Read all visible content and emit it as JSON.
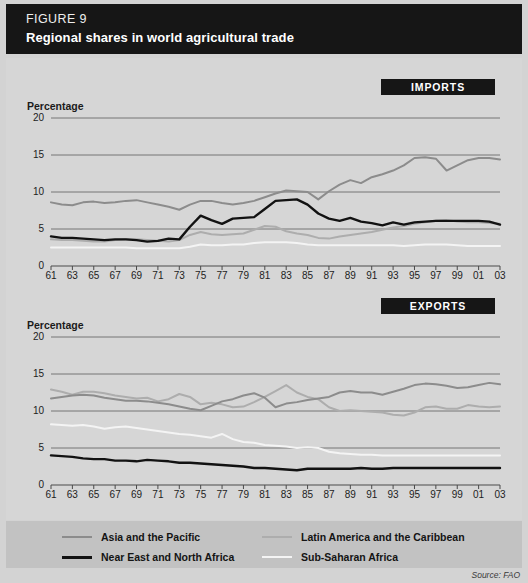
{
  "header": {
    "figure_label": "FIGURE 9",
    "title": "Regional shares in world agricultural trade"
  },
  "source": "Source: FAO",
  "panels": [
    {
      "key": "imports",
      "badge": "IMPORTS",
      "axis_title": "Percentage"
    },
    {
      "key": "exports",
      "badge": "EXPORTS",
      "axis_title": "Percentage"
    }
  ],
  "legend": {
    "items": [
      {
        "label": "Asia and the Pacific",
        "color": "#8c8c8c"
      },
      {
        "label": "Near East and North Africa",
        "color": "#121212"
      },
      {
        "label": "Latin America and the Caribbean",
        "color": "#adadad"
      },
      {
        "label": "Sub-Saharan Africa",
        "color": "#f4f4f4"
      }
    ]
  },
  "colors": {
    "panel_background": "#d6d6d6",
    "legend_background": "#c2c2c2",
    "header_background": "#161616",
    "gridline": "#5d5d5d",
    "axis": "#4a4a4a",
    "text": "#1d1d1d"
  },
  "chart_data": [
    {
      "type": "line",
      "title": "IMPORTS",
      "subtitle": "Regional shares in world agricultural trade — imports",
      "xlabel": "",
      "ylabel": "Percentage",
      "xlim": [
        1961,
        2003
      ],
      "ylim": [
        0,
        20
      ],
      "yticks": [
        0,
        5,
        10,
        15,
        20
      ],
      "grid": true,
      "legend_position": "bottom",
      "x": [
        1961,
        1962,
        1963,
        1964,
        1965,
        1966,
        1967,
        1968,
        1969,
        1970,
        1971,
        1972,
        1973,
        1974,
        1975,
        1976,
        1977,
        1978,
        1979,
        1980,
        1981,
        1982,
        1983,
        1984,
        1985,
        1986,
        1987,
        1988,
        1989,
        1990,
        1991,
        1992,
        1993,
        1994,
        1995,
        1996,
        1997,
        1998,
        1999,
        2000,
        2001,
        2002,
        2003
      ],
      "xtick_labels": [
        "61",
        "63",
        "65",
        "67",
        "69",
        "71",
        "73",
        "75",
        "77",
        "79",
        "81",
        "83",
        "85",
        "87",
        "89",
        "91",
        "93",
        "95",
        "97",
        "99",
        "01",
        "03"
      ],
      "series": [
        {
          "name": "Asia and the Pacific",
          "color": "#8c8c8c",
          "values": [
            8.6,
            8.3,
            8.2,
            8.6,
            8.7,
            8.5,
            8.6,
            8.8,
            8.9,
            8.6,
            8.3,
            8.0,
            7.6,
            8.3,
            8.8,
            8.8,
            8.5,
            8.3,
            8.5,
            8.8,
            9.3,
            9.8,
            10.2,
            10.1,
            10.0,
            9.0,
            10.1,
            11.0,
            11.6,
            11.2,
            12.0,
            12.4,
            12.9,
            13.6,
            14.6,
            14.7,
            14.5,
            12.9,
            13.6,
            14.3,
            14.6,
            14.6,
            14.4
          ]
        },
        {
          "name": "Near East and North Africa",
          "color": "#121212",
          "values": [
            4.0,
            3.8,
            3.8,
            3.7,
            3.6,
            3.5,
            3.6,
            3.6,
            3.5,
            3.3,
            3.4,
            3.7,
            3.6,
            5.3,
            6.8,
            6.2,
            5.7,
            6.4,
            6.5,
            6.6,
            7.7,
            8.8,
            8.9,
            9.0,
            8.3,
            7.1,
            6.4,
            6.1,
            6.5,
            6.0,
            5.8,
            5.5,
            5.9,
            5.6,
            5.9,
            6.0,
            6.1,
            6.1,
            6.1,
            6.1,
            6.1,
            6.0,
            5.6
          ]
        },
        {
          "name": "Latin America and the Caribbean",
          "color": "#adadad",
          "values": [
            3.6,
            3.5,
            3.5,
            3.4,
            3.3,
            3.3,
            3.5,
            3.6,
            3.6,
            3.5,
            3.4,
            3.3,
            3.5,
            4.2,
            4.6,
            4.3,
            4.2,
            4.3,
            4.4,
            4.9,
            5.4,
            5.3,
            4.7,
            4.4,
            4.2,
            3.8,
            3.7,
            4.0,
            4.2,
            4.4,
            4.6,
            4.9,
            5.2,
            5.4,
            5.7,
            5.9,
            6.1,
            6.2,
            6.0,
            5.9,
            5.9,
            5.8,
            5.7
          ]
        },
        {
          "name": "Sub-Saharan Africa",
          "color": "#f4f4f4",
          "values": [
            2.5,
            2.5,
            2.5,
            2.5,
            2.5,
            2.5,
            2.5,
            2.5,
            2.4,
            2.4,
            2.4,
            2.4,
            2.4,
            2.6,
            2.9,
            2.8,
            2.8,
            2.9,
            2.9,
            3.1,
            3.2,
            3.2,
            3.2,
            3.1,
            2.9,
            2.8,
            2.8,
            2.8,
            2.8,
            2.8,
            2.8,
            2.8,
            2.8,
            2.7,
            2.8,
            2.9,
            2.9,
            2.9,
            2.8,
            2.7,
            2.7,
            2.7,
            2.7
          ]
        }
      ]
    },
    {
      "type": "line",
      "title": "EXPORTS",
      "subtitle": "Regional shares in world agricultural trade — exports",
      "xlabel": "",
      "ylabel": "Percentage",
      "xlim": [
        1961,
        2003
      ],
      "ylim": [
        0,
        20
      ],
      "yticks": [
        0,
        5,
        10,
        15,
        20
      ],
      "grid": true,
      "legend_position": "bottom",
      "x": [
        1961,
        1962,
        1963,
        1964,
        1965,
        1966,
        1967,
        1968,
        1969,
        1970,
        1971,
        1972,
        1973,
        1974,
        1975,
        1976,
        1977,
        1978,
        1979,
        1980,
        1981,
        1982,
        1983,
        1984,
        1985,
        1986,
        1987,
        1988,
        1989,
        1990,
        1991,
        1992,
        1993,
        1994,
        1995,
        1996,
        1997,
        1998,
        1999,
        2000,
        2001,
        2002,
        2003
      ],
      "xtick_labels": [
        "61",
        "63",
        "65",
        "67",
        "69",
        "71",
        "73",
        "75",
        "77",
        "79",
        "81",
        "83",
        "85",
        "87",
        "89",
        "91",
        "93",
        "95",
        "97",
        "99",
        "01",
        "03"
      ],
      "series": [
        {
          "name": "Asia and the Pacific",
          "color": "#8c8c8c",
          "values": [
            11.7,
            11.9,
            12.1,
            12.2,
            12.1,
            11.8,
            11.6,
            11.4,
            11.4,
            11.3,
            11.1,
            10.9,
            10.6,
            10.3,
            10.1,
            10.7,
            11.3,
            11.6,
            12.1,
            12.4,
            11.8,
            10.5,
            11.0,
            11.2,
            11.5,
            11.7,
            11.9,
            12.5,
            12.7,
            12.5,
            12.5,
            12.2,
            12.6,
            13.0,
            13.5,
            13.7,
            13.6,
            13.4,
            13.1,
            13.2,
            13.5,
            13.8,
            13.6
          ]
        },
        {
          "name": "Near East and North Africa",
          "color": "#121212",
          "values": [
            4.0,
            3.9,
            3.8,
            3.6,
            3.5,
            3.5,
            3.3,
            3.3,
            3.2,
            3.4,
            3.3,
            3.2,
            3.0,
            3.0,
            2.9,
            2.8,
            2.7,
            2.6,
            2.5,
            2.3,
            2.3,
            2.2,
            2.1,
            2.0,
            2.2,
            2.2,
            2.2,
            2.2,
            2.2,
            2.3,
            2.2,
            2.2,
            2.3,
            2.3,
            2.3,
            2.3,
            2.3,
            2.3,
            2.3,
            2.3,
            2.3,
            2.3,
            2.3
          ]
        },
        {
          "name": "Latin America and the Caribbean",
          "color": "#adadad",
          "values": [
            12.9,
            12.6,
            12.2,
            12.6,
            12.6,
            12.4,
            12.1,
            11.9,
            11.7,
            11.8,
            11.3,
            11.6,
            12.3,
            11.9,
            10.9,
            11.1,
            10.9,
            10.5,
            10.6,
            11.2,
            11.9,
            12.7,
            13.5,
            12.5,
            11.9,
            11.6,
            10.5,
            10.0,
            10.1,
            10.0,
            9.9,
            9.8,
            9.5,
            9.4,
            9.8,
            10.5,
            10.6,
            10.3,
            10.3,
            10.8,
            10.6,
            10.5,
            10.6
          ]
        },
        {
          "name": "Sub-Saharan Africa",
          "color": "#f4f4f4",
          "values": [
            8.2,
            8.1,
            8.0,
            8.1,
            7.9,
            7.6,
            7.8,
            7.9,
            7.7,
            7.5,
            7.3,
            7.1,
            6.9,
            6.8,
            6.6,
            6.4,
            6.9,
            6.2,
            5.8,
            5.7,
            5.4,
            5.3,
            5.2,
            5.0,
            5.1,
            5.0,
            4.5,
            4.3,
            4.2,
            4.1,
            4.1,
            4.0,
            4.0,
            4.0,
            4.0,
            4.0,
            4.0,
            4.0,
            4.0,
            4.0,
            4.0,
            4.0,
            4.0
          ]
        }
      ]
    }
  ]
}
